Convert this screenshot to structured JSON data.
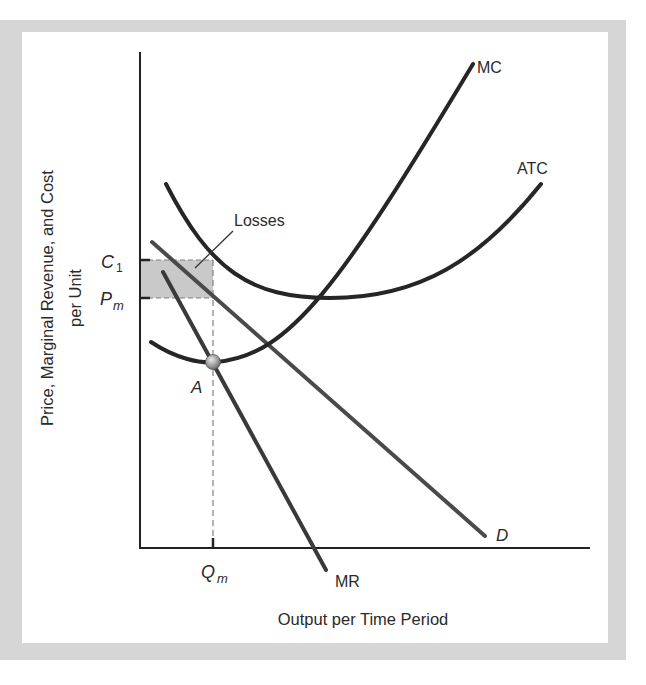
{
  "figure": {
    "type": "monopoly-losses-diagram",
    "y_axis_label": [
      "Price, Marginal Revenue, and Cost",
      "per Unit"
    ],
    "x_axis_label": "Output per Time Period",
    "curves": {
      "mc": "MC",
      "atc": "ATC",
      "d": "D",
      "mr": "MR"
    },
    "annotations": {
      "losses": "Losses",
      "point_a": "A"
    },
    "y_ticks": {
      "c1_main": "C",
      "c1_sub": "1",
      "pm_main": "P",
      "pm_sub": "m"
    },
    "x_ticks": {
      "qm_main": "Q",
      "qm_sub": "m"
    },
    "colors": {
      "frame": "#d6d6d6",
      "curve": "#262626",
      "line": "#4a4a4a",
      "shade": "#c9c9c9",
      "point": "#9a9a9a"
    }
  }
}
